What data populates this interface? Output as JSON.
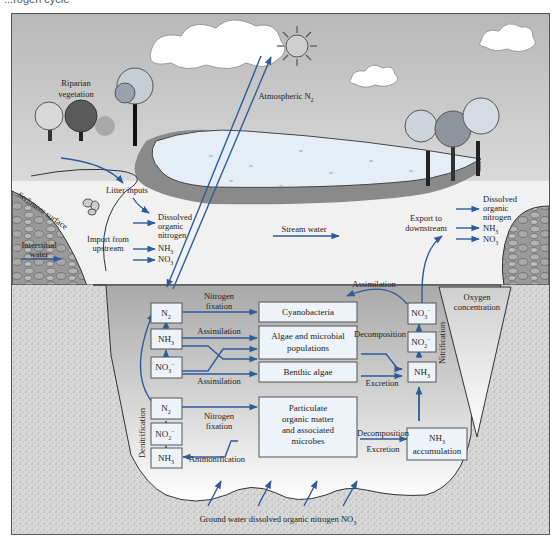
{
  "title_fragment": "...rogen cycle",
  "colors": {
    "arrow": "#2f5b9a",
    "box_fill": "#eef3fa",
    "box_stroke": "#555555",
    "sky_top": "#bdbdbd",
    "sky_bottom": "#ececec",
    "water_surface": "#f2f2f2",
    "under_water": "#b9b9b9",
    "pool": "#e6eef7",
    "bank": "#8a8a8a",
    "sediment": "#d0d0d0"
  },
  "above_water": {
    "riparian": [
      "Riparian",
      "vegetation"
    ],
    "atmospheric_n2": "Atmospheric N",
    "atmospheric_n2_sub": "2",
    "litter_inputs": "Litter inputs",
    "sediment_surface": "Sediment surface",
    "interstitial_water": [
      "Interstitial",
      "water"
    ],
    "import_from_upstream": [
      "Import from",
      "upstream"
    ],
    "inputs": [
      "Dissolved",
      "organic",
      "nitrogen"
    ],
    "nh3": "NH",
    "nh3_sub": "3",
    "no3": "NO",
    "no3_sub": "3",
    "stream_water": "Stream water",
    "export_to_downstream": [
      "Export to",
      "downstream"
    ],
    "outputs": [
      "Dissolved",
      "organic",
      "nitrogen"
    ]
  },
  "under_water": {
    "oxygen_concentration": [
      "Oxygen",
      "concentration"
    ],
    "nitrification": "Nitrification",
    "denitrification": "Denitrification",
    "left_upper_boxes": [
      {
        "label": "N",
        "sub": "2",
        "sup": ""
      },
      {
        "label": "NH",
        "sub": "3",
        "sup": ""
      },
      {
        "label": "NO",
        "sub": "3",
        "sup": "−"
      }
    ],
    "left_lower_boxes": [
      {
        "label": "N",
        "sub": "2",
        "sup": ""
      },
      {
        "label": "NO",
        "sub": "2",
        "sup": "−"
      },
      {
        "label": "NH",
        "sub": "3",
        "sup": ""
      }
    ],
    "right_boxes": [
      {
        "label": "NO",
        "sub": "3",
        "sup": "−"
      },
      {
        "label": "NO",
        "sub": "2",
        "sup": "−"
      },
      {
        "label": "NH",
        "sub": "3",
        "sup": ""
      }
    ],
    "center_boxes": {
      "cyanobacteria": "Cyanobacteria",
      "algae": [
        "Algae and microbial",
        "populations"
      ],
      "benthic": "Benthic algae",
      "particulate": [
        "Particulate",
        "organic matter",
        "and associated",
        "microbes"
      ],
      "nh3_accum": [
        "NH",
        "accumulation"
      ],
      "nh3_accum_sub": "3"
    },
    "process_labels": {
      "nitrogen_fixation_top": [
        "Nitrogen",
        "fixation"
      ],
      "assimilation_1": "Assimilation",
      "assimilation_2": "Assimilation",
      "assimilation_top": "Assimilation",
      "decomposition": "Decomposition",
      "excretion": "Excretion",
      "nitrogen_fixation_bottom": [
        "Nitrogen",
        "fixation"
      ],
      "ammonification": "Ammonification",
      "decomposition_2": "Decomposition",
      "excretion_2": "Excretion"
    },
    "ground_water": "Ground water dissolved organic nitrogen NO",
    "ground_water_sub": "3"
  }
}
